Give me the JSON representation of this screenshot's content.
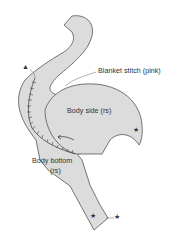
{
  "diagram": {
    "labels": {
      "blanket_stitch": "Blanket stitch (pink)",
      "body_side": "Body side (rs)",
      "body_bottom_line1": "Body bottom",
      "body_bottom_line2": "(rs)"
    },
    "markers": {
      "triangle": "▲",
      "star": "★"
    },
    "colors": {
      "fill": "#dcdcdc",
      "outline": "#555555",
      "stitch": "#444444"
    }
  }
}
